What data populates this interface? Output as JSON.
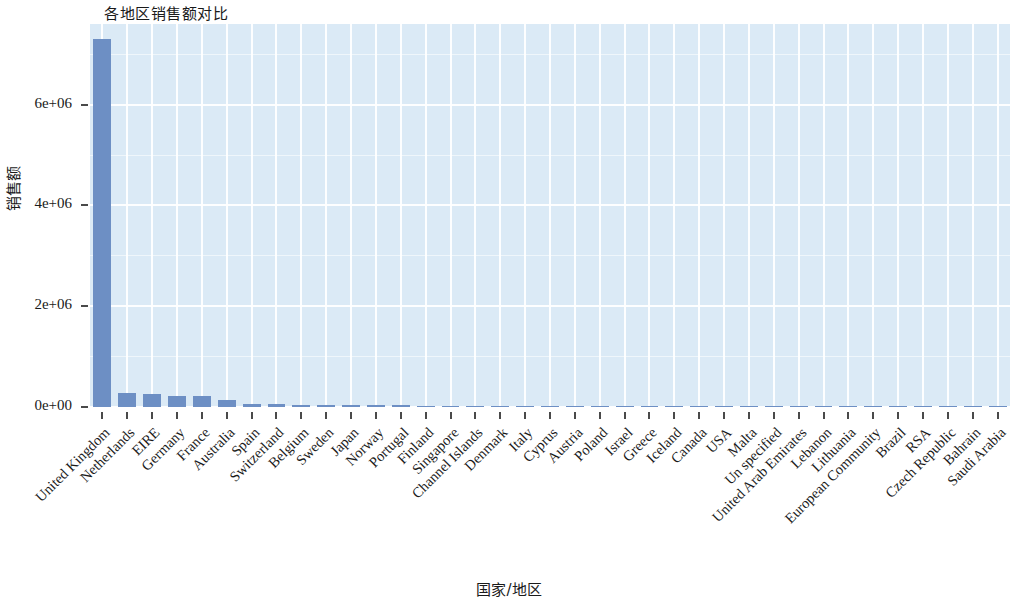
{
  "chart_data": {
    "type": "bar",
    "title": "各地区销售额对比",
    "xlabel": "国家/地区",
    "ylabel": "销售额",
    "ylim": [
      0,
      7600000
    ],
    "ytick_labels": [
      "0e+00",
      "2e+06",
      "4e+06",
      "6e+06"
    ],
    "ytick_values": [
      0,
      2000000,
      4000000,
      6000000
    ],
    "grid": true,
    "legend": "none",
    "bar_color": "#6d8fc4",
    "panel_color": "#dbeaf6",
    "grid_color": "#ffffff",
    "categories": [
      "United Kingdom",
      "Netherlands",
      "EIRE",
      "Germany",
      "France",
      "Australia",
      "Spain",
      "Switzerland",
      "Belgium",
      "Sweden",
      "Japan",
      "Norway",
      "Portugal",
      "Finland",
      "Singapore",
      "Channel Islands",
      "Denmark",
      "Italy",
      "Cyprus",
      "Austria",
      "Poland",
      "Israel",
      "Greece",
      "Iceland",
      "Canada",
      "USA",
      "Malta",
      "Un specified",
      "United Arab Emirates",
      "Lebanon",
      "Lithuania",
      "European Community",
      "Brazil",
      "RSA",
      "Czech Republic",
      "Bahrain",
      "Saudi Arabia"
    ],
    "values": [
      7300000,
      285000,
      265000,
      228000,
      209000,
      138000,
      61000,
      57000,
      41000,
      38000,
      37000,
      36000,
      33000,
      22000,
      21000,
      20000,
      19000,
      17000,
      13000,
      10200,
      7300,
      7900,
      4800,
      4300,
      3700,
      3600,
      2700,
      2500,
      1900,
      1700,
      1700,
      1300,
      1200,
      1000,
      830,
      550,
      150
    ]
  }
}
